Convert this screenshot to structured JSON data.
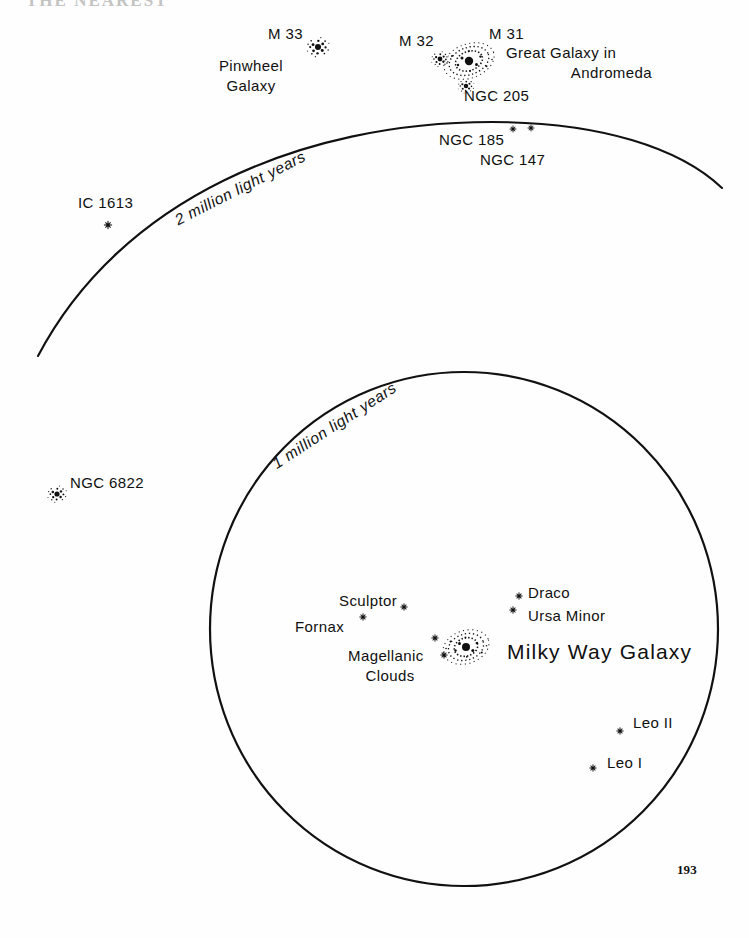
{
  "page": {
    "heading_partial": "THE NEAREST",
    "page_number": "193"
  },
  "diagram": {
    "scale_rings": [
      {
        "name": "two-million-ring",
        "label": "2 million light years",
        "type": "arc"
      },
      {
        "name": "one-million-ring",
        "label": "1 million light years",
        "type": "circle"
      }
    ],
    "labels": {
      "m33": "M 33",
      "m33_sub1": "Pinwheel",
      "m33_sub2": "Galaxy",
      "m32": "M 32",
      "m31": "M 31",
      "m31_sub1": "Great Galaxy in",
      "m31_sub2": "Andromeda",
      "ngc205": "NGC 205",
      "ngc185": "NGC 185",
      "ngc147": "NGC 147",
      "ic1613": "IC 1613",
      "ngc6822": "NGC 6822",
      "sculptor": "Sculptor",
      "fornax": "Fornax",
      "draco": "Draco",
      "ursa_minor": "Ursa Minor",
      "magellanic1": "Magellanic",
      "magellanic2": "Clouds",
      "milky_way": "Milky Way Galaxy",
      "leo2": "Leo II",
      "leo1": "Leo I",
      "arc_2my": "2 million light years",
      "arc_1my": "1 million light years"
    },
    "colors": {
      "ink": "#101010",
      "paper": "#fefefe",
      "line": "#111111"
    }
  }
}
